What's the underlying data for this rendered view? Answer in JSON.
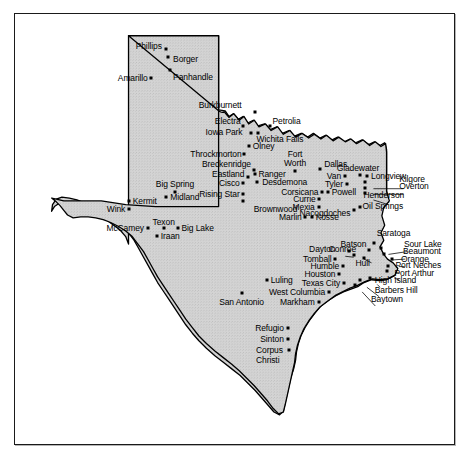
{
  "figure": {
    "frame": {
      "x": 14,
      "y": 13,
      "width": 441,
      "height": 432
    },
    "colors": {
      "land_fill": "#d2d2d2",
      "land_stroke": "#000000",
      "water_fill": "#ffffff",
      "frame_stroke": "#1a1a1a",
      "dot": "#000000",
      "text": "#000000"
    }
  },
  "map": {
    "region": "Texas",
    "cities": [
      {
        "name": "Phillips",
        "dot": [
          167,
          44
        ],
        "label": [
          163,
          41
        ],
        "align": "r"
      },
      {
        "name": "Borger",
        "dot": [
          170,
          52
        ],
        "label": [
          175,
          55
        ],
        "align": "l"
      },
      {
        "name": "Panhandle",
        "dot": [
          172,
          66
        ],
        "label": [
          175,
          74
        ],
        "align": "l"
      },
      {
        "name": "Amarillo",
        "dot": [
          152,
          75
        ],
        "label": [
          148,
          75
        ],
        "align": "r"
      },
      {
        "name": "Burkburnett",
        "dot": [
          262,
          111
        ],
        "label": [
          248,
          104
        ],
        "align": "r"
      },
      {
        "name": "Petrolia",
        "dot": [
          278,
          126
        ],
        "label": [
          281,
          121
        ],
        "align": "l"
      },
      {
        "name": "Electra",
        "dot": [
          250,
          126
        ],
        "label": [
          247,
          121
        ],
        "align": "r"
      },
      {
        "name": "Iowa Park",
        "dot": [
          258,
          133
        ],
        "label": [
          249,
          132
        ],
        "align": "r"
      },
      {
        "name": "Wichita Falls",
        "dot": [
          266,
          133
        ],
        "label": [
          264,
          140
        ],
        "align": "l"
      },
      {
        "name": "Olney",
        "dot": [
          256,
          147
        ],
        "label": [
          260,
          147
        ],
        "align": "l"
      },
      {
        "name": "Throckmorton",
        "dot": [
          251,
          156
        ],
        "label": [
          248,
          156
        ],
        "align": "r"
      },
      {
        "name": "Breckenridge",
        "dot": [
          261,
          173
        ],
        "label": [
          258,
          166
        ],
        "align": "r"
      },
      {
        "name": "Eastland",
        "dot": [
          255,
          180
        ],
        "label": [
          251,
          177
        ],
        "align": "r"
      },
      {
        "name": "Ranger",
        "dot": [
          262,
          177
        ],
        "label": [
          266,
          177
        ],
        "align": "l"
      },
      {
        "name": "Cisco",
        "dot": [
          250,
          187
        ],
        "label": [
          246,
          187
        ],
        "align": "r"
      },
      {
        "name": "Desdemona",
        "dot": [
          264,
          186
        ],
        "label": [
          270,
          186
        ],
        "align": "l"
      },
      {
        "name": "Rising Star",
        "dot": [
          250,
          198
        ],
        "label": [
          246,
          198
        ],
        "align": "r"
      },
      {
        "name": "Brownwood",
        "dot": [
          250,
          206
        ],
        "label": [
          261,
          214
        ],
        "align": "l"
      },
      {
        "name": "Fort\nWorth",
        "dot": [
          305,
          174
        ],
        "label": [
          305,
          161
        ],
        "align": "c"
      },
      {
        "name": "Dallas",
        "dot": [
          332,
          172
        ],
        "label": [
          336,
          166
        ],
        "align": "l"
      },
      {
        "name": "Van",
        "dot": [
          358,
          179
        ],
        "label": [
          354,
          179
        ],
        "align": "r"
      },
      {
        "name": "Tyler",
        "dot": [
          360,
          188
        ],
        "label": [
          356,
          188
        ],
        "align": "r"
      },
      {
        "name": "Powell",
        "dot": [
          340,
          196
        ],
        "label": [
          344,
          196
        ],
        "align": "l"
      },
      {
        "name": "Corsicana",
        "dot": [
          334,
          196
        ],
        "label": [
          330,
          196
        ],
        "align": "r"
      },
      {
        "name": "Currie",
        "dot": [
          331,
          204
        ],
        "label": [
          327,
          204
        ],
        "align": "r"
      },
      {
        "name": "Mexia",
        "dot": [
          330,
          212
        ],
        "label": [
          326,
          212
        ],
        "align": "r"
      },
      {
        "name": "Marlin",
        "dot": [
          316,
          223
        ],
        "label": [
          312,
          223
        ],
        "align": "r"
      },
      {
        "name": "Kosse",
        "dot": [
          323,
          223
        ],
        "label": [
          327,
          223
        ],
        "align": "l"
      },
      {
        "name": "Gladewater",
        "dot": [
          374,
          178
        ],
        "label": [
          372,
          171
        ],
        "align": "c"
      },
      {
        "name": "Longview",
        "dot": [
          382,
          179
        ],
        "label": [
          386,
          179
        ],
        "align": "l"
      },
      {
        "name": "Kilgore",
        "dot": [
          380,
          186
        ],
        "label": [
          416,
          182
        ],
        "align": "l"
      },
      {
        "name": "Overton",
        "dot": [
          380,
          192
        ],
        "label": [
          416,
          190
        ],
        "align": "l"
      },
      {
        "name": "Henderson",
        "dot": [
          380,
          197
        ],
        "label": [
          378,
          199
        ],
        "align": "l"
      },
      {
        "name": "Oil Springs",
        "dot": [
          374,
          212
        ],
        "label": [
          377,
          211
        ],
        "align": "l"
      },
      {
        "name": "Nacogdoches",
        "dot": [
          368,
          215
        ],
        "label": [
          364,
          219
        ],
        "align": "r"
      },
      {
        "name": "Big Spring",
        "dot": [
          177,
          196
        ],
        "label": [
          177,
          188
        ],
        "align": "c"
      },
      {
        "name": "Midland",
        "dot": [
          168,
          202
        ],
        "label": [
          172,
          202
        ],
        "align": "l"
      },
      {
        "name": "Kermit",
        "dot": [
          128,
          206
        ],
        "label": [
          132,
          206
        ],
        "align": "l"
      },
      {
        "name": "Wink",
        "dot": [
          128,
          214
        ],
        "label": [
          124,
          214
        ],
        "align": "r"
      },
      {
        "name": "Texon",
        "dot": [
          165,
          235
        ],
        "label": [
          165,
          228
        ],
        "align": "c"
      },
      {
        "name": "Big Lake",
        "dot": [
          180,
          235
        ],
        "label": [
          184,
          235
        ],
        "align": "l"
      },
      {
        "name": "McCamey",
        "dot": [
          148,
          234
        ],
        "label": [
          144,
          234
        ],
        "align": "r"
      },
      {
        "name": "Iraan",
        "dot": [
          158,
          243
        ],
        "label": [
          162,
          243
        ],
        "align": "l"
      },
      {
        "name": "Saratoga",
        "dot": [
          389,
          250
        ],
        "label": [
          392,
          240
        ],
        "align": "l"
      },
      {
        "name": "Batson",
        "dot": [
          384,
          258
        ],
        "label": [
          381,
          252
        ],
        "align": "r"
      },
      {
        "name": "Sour Lake",
        "dot": [
          397,
          256
        ],
        "label": [
          421,
          251
        ],
        "align": "l"
      },
      {
        "name": "Beaumont",
        "dot": [
          400,
          262
        ],
        "label": [
          420,
          259
        ],
        "align": "l"
      },
      {
        "name": "Orange",
        "dot": [
          408,
          268
        ],
        "label": [
          418,
          267
        ],
        "align": "l"
      },
      {
        "name": "Port Neches",
        "dot": [
          404,
          275
        ],
        "label": [
          412,
          274
        ],
        "align": "l"
      },
      {
        "name": "Port Arthur",
        "dot": [
          403,
          280
        ],
        "label": [
          411,
          282
        ],
        "align": "l"
      },
      {
        "name": "Hull",
        "dot": [
          378,
          266
        ],
        "label": [
          377,
          272
        ],
        "align": "c"
      },
      {
        "name": "Conroe",
        "dot": [
          362,
          259
        ],
        "label": [
          341,
          257
        ],
        "align": "l"
      },
      {
        "name": "Dayton",
        "dot": [
          368,
          263
        ],
        "label": [
          320,
          257
        ],
        "align": "l"
      },
      {
        "name": "Tomball",
        "dot": [
          348,
          268
        ],
        "label": [
          344,
          268
        ],
        "align": "r"
      },
      {
        "name": "Humble",
        "dot": [
          356,
          275
        ],
        "label": [
          352,
          275
        ],
        "align": "r"
      },
      {
        "name": "Houston",
        "dot": [
          352,
          283
        ],
        "label": [
          348,
          283
        ],
        "align": "r"
      },
      {
        "name": "Texas City",
        "dot": [
          357,
          293
        ],
        "label": [
          353,
          293
        ],
        "align": "r"
      },
      {
        "name": "High Island",
        "dot": [
          385,
          288
        ],
        "label": [
          390,
          290
        ],
        "align": "l"
      },
      {
        "name": "Barbers Hill",
        "dot": [
          374,
          290
        ],
        "label": [
          390,
          300
        ],
        "align": "l"
      },
      {
        "name": "Baytown",
        "dot": [
          369,
          295
        ],
        "label": [
          386,
          310
        ],
        "align": "l"
      },
      {
        "name": "West Columbia",
        "dot": [
          341,
          303
        ],
        "label": [
          337,
          303
        ],
        "align": "r"
      },
      {
        "name": "Markham",
        "dot": [
          330,
          313
        ],
        "label": [
          326,
          313
        ],
        "align": "r"
      },
      {
        "name": "Luling",
        "dot": [
          275,
          290
        ],
        "label": [
          279,
          290
        ],
        "align": "l"
      },
      {
        "name": "San Antonio",
        "dot": [
          248,
          304
        ],
        "label": [
          248,
          313
        ],
        "align": "c"
      },
      {
        "name": "Refugio",
        "dot": [
          297,
          341
        ],
        "label": [
          293,
          341
        ],
        "align": "r"
      },
      {
        "name": "Sinton",
        "dot": [
          297,
          353
        ],
        "label": [
          293,
          353
        ],
        "align": "r"
      },
      {
        "name": "Corpus\nChristi",
        "dot": [
          299,
          364
        ],
        "label": [
          292,
          370
        ],
        "align": "r"
      }
    ],
    "leader_lines": [
      {
        "from": [
          382,
          186
        ],
        "to": [
          414,
          186
        ]
      },
      {
        "from": [
          382,
          192
        ],
        "to": [
          414,
          192
        ]
      },
      {
        "from": [
          382,
          198
        ],
        "to": [
          400,
          202
        ]
      },
      {
        "from": [
          398,
          256
        ],
        "to": [
          418,
          253
        ]
      },
      {
        "from": [
          401,
          262
        ],
        "to": [
          417,
          261
        ]
      },
      {
        "from": [
          409,
          268
        ],
        "to": [
          416,
          269
        ]
      },
      {
        "from": [
          405,
          275
        ],
        "to": [
          410,
          276
        ]
      },
      {
        "from": [
          404,
          281
        ],
        "to": [
          409,
          283
        ]
      },
      {
        "from": [
          386,
          288
        ],
        "to": [
          388,
          291
        ]
      },
      {
        "from": [
          375,
          291
        ],
        "to": [
          388,
          301
        ]
      },
      {
        "from": [
          370,
          296
        ],
        "to": [
          384,
          311
        ]
      }
    ]
  }
}
